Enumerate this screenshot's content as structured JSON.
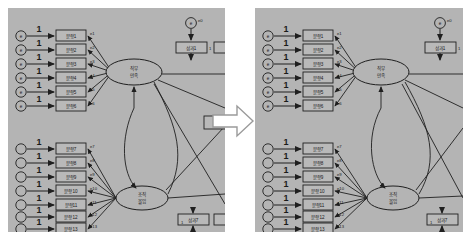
{
  "figure": {
    "type": "sem-path-diagram-comparison",
    "canvas_color": "#b4b4b4",
    "page_background": "#ffffff",
    "line_color": "#2b2b2b",
    "text_color": "#1a1a1a"
  },
  "transform_arrow": {
    "name": "right-block-arrow",
    "direction": "right",
    "fill": "#ffffff",
    "stroke": "#8c8c8c"
  },
  "panels": [
    {
      "id": "left",
      "label": "initial-model",
      "factors": [
        {
          "id": "f1",
          "shape": "ellipse",
          "line1": "직무",
          "line2": "만족",
          "indicator_count": 6,
          "indicators": [
            {
              "box": "문항1",
              "error": "e1",
              "weight": "1"
            },
            {
              "box": "문항2",
              "error": "e2",
              "weight": "1"
            },
            {
              "box": "문항3",
              "error": "e3",
              "weight": "1"
            },
            {
              "box": "문항4",
              "error": "e4",
              "weight": "1"
            },
            {
              "box": "문항5",
              "error": "e5",
              "weight": "1"
            },
            {
              "box": "문항6",
              "error": "e6",
              "weight": "1"
            }
          ]
        },
        {
          "id": "f2",
          "shape": "ellipse",
          "line1": "조직",
          "line2": "몰입",
          "indicator_count": 7,
          "indicators": [
            {
              "box": "문항7",
              "error": "e7",
              "weight": "1"
            },
            {
              "box": "문항8",
              "error": "e8",
              "weight": "1"
            },
            {
              "box": "문항9",
              "error": "e9",
              "weight": "1"
            },
            {
              "box": "문항10",
              "error": "e10",
              "weight": "1"
            },
            {
              "box": "문항11",
              "error": "e11",
              "weight": "1"
            },
            {
              "box": "문항12",
              "error": "e12",
              "weight": "1"
            },
            {
              "box": "문항13",
              "error": "e13",
              "weight": "1"
            }
          ]
        }
      ],
      "outcomes": [
        {
          "id": "y1",
          "box": "성과1",
          "error": "e0",
          "weight": "1",
          "position": "top-right"
        },
        {
          "id": "y2",
          "box": "성과7",
          "error": "",
          "weight": "1",
          "position": "bottom-right"
        }
      ]
    },
    {
      "id": "right",
      "label": "revised-model",
      "factors": [
        {
          "id": "f1",
          "shape": "ellipse",
          "line1": "직무",
          "line2": "만족",
          "indicator_count": 6,
          "indicators": [
            {
              "box": "문항1",
              "error": "e1",
              "weight": "1"
            },
            {
              "box": "문항2",
              "error": "e2",
              "weight": "1"
            },
            {
              "box": "문항3",
              "error": "e3",
              "weight": "1"
            },
            {
              "box": "문항4",
              "error": "e4",
              "weight": "1"
            },
            {
              "box": "문항5",
              "error": "e5",
              "weight": "1"
            },
            {
              "box": "문항6",
              "error": "e6",
              "weight": "1"
            }
          ]
        },
        {
          "id": "f2",
          "shape": "ellipse",
          "line1": "조직",
          "line2": "몰입",
          "indicator_count": 7,
          "indicators": [
            {
              "box": "문항7",
              "error": "e7",
              "weight": "1"
            },
            {
              "box": "문항8",
              "error": "e8",
              "weight": "1"
            },
            {
              "box": "문항9",
              "error": "e9",
              "weight": "1"
            },
            {
              "box": "문항10",
              "error": "e10",
              "weight": "1"
            },
            {
              "box": "문항11",
              "error": "e11",
              "weight": "1"
            },
            {
              "box": "문항12",
              "error": "e12",
              "weight": "1"
            },
            {
              "box": "문항13",
              "error": "e13",
              "weight": "1"
            }
          ]
        }
      ],
      "outcomes": [
        {
          "id": "y1",
          "box": "성과1",
          "error": "e0",
          "weight": "1",
          "position": "top-right"
        },
        {
          "id": "y2",
          "box": "성과7",
          "error": "",
          "weight": "1",
          "position": "bottom-right"
        }
      ]
    }
  ]
}
